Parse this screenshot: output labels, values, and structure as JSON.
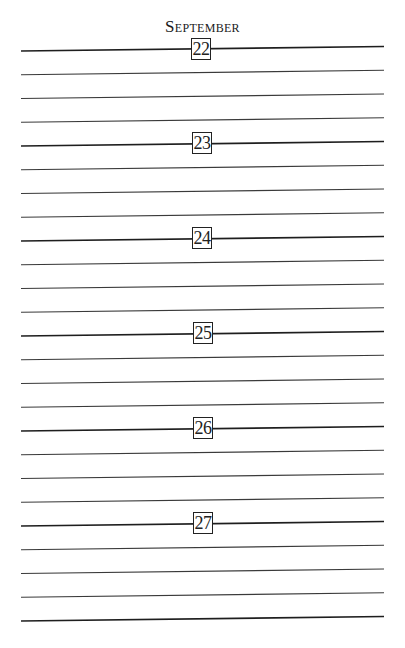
{
  "page": {
    "month": "September",
    "days": [
      {
        "day": "22"
      },
      {
        "day": "23"
      },
      {
        "day": "24"
      },
      {
        "day": "25"
      },
      {
        "day": "26"
      },
      {
        "day": "27"
      }
    ],
    "lines_per_day": 4,
    "total_ruled_lines": 25
  }
}
